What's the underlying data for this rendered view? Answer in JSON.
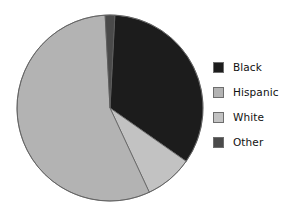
{
  "chart_data": {
    "type": "pie",
    "title": "",
    "subtitle": "",
    "xlabel": "",
    "ylabel": "",
    "grid": false,
    "legend_position": "right",
    "categories": [
      "Black",
      "Hispanic",
      "White",
      "Other"
    ],
    "values": [
      32,
      57,
      8,
      3
    ],
    "units": "percent",
    "colors": [
      "#1c1c1c",
      "#b3b3b3",
      "#c2c2c2",
      "#4a4a4a"
    ],
    "slice_order_clockwise_from_top": [
      "Other",
      "Black",
      "White",
      "Hispanic"
    ],
    "annotations": [],
    "slices": [
      {
        "label": "Black",
        "value": 32,
        "color": "#1c1c1c",
        "start_angle_deg": 3,
        "end_angle_deg": 125
      },
      {
        "label": "White",
        "value": 8,
        "color": "#c2c2c2",
        "start_angle_deg": 125,
        "end_angle_deg": 155
      },
      {
        "label": "Hispanic",
        "value": 57,
        "color": "#b3b3b3",
        "start_angle_deg": 155,
        "end_angle_deg": 357
      },
      {
        "label": "Other",
        "value": 3,
        "color": "#4a4a4a",
        "start_angle_deg": 357,
        "end_angle_deg": 363
      }
    ],
    "geometry": {
      "cx": 110,
      "cy": 108,
      "r": 93,
      "stroke": "#5e5e5e",
      "stroke_width": 0.8
    }
  },
  "legend": {
    "items": [
      {
        "label": "Black",
        "color": "#1c1c1c"
      },
      {
        "label": "Hispanic",
        "color": "#b3b3b3"
      },
      {
        "label": "White",
        "color": "#c2c2c2"
      },
      {
        "label": "Other",
        "color": "#4a4a4a"
      }
    ]
  }
}
